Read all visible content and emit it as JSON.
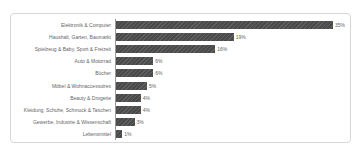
{
  "chart_data": {
    "type": "bar",
    "orientation": "horizontal",
    "title": "",
    "xlabel": "",
    "ylabel": "",
    "xlim": [
      0,
      36
    ],
    "grid": false,
    "legend": false,
    "bar_color": "#4d4d4d",
    "label_color": "#666666",
    "axis_line_color": "#9a9a9a",
    "categories": [
      "Elektronik & Computer",
      "Haushalt, Garten, Baumarkt",
      "Spielzeug & Baby, Sport & Freizeit",
      "Auto & Motorrad",
      "Bücher",
      "Möbel & Wohnaccessoires",
      "Beauty & Drogerie",
      "Kleidung, Schuhe, Schmuck & Taschen",
      "Gewerbe, Industrie & Wissenschaft",
      "Lebensmittel"
    ],
    "values": [
      35,
      19,
      16,
      6,
      6,
      5,
      4,
      4,
      3,
      1
    ],
    "value_labels": [
      "35%",
      "19%",
      "16%",
      "6%",
      "6%",
      "5%",
      "4%",
      "4%",
      "3%",
      "1%"
    ]
  },
  "card": {
    "border_color": "#d7d7d7",
    "background": "#ffffff"
  }
}
